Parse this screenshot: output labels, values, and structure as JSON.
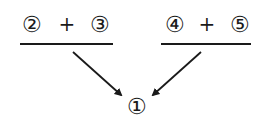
{
  "diagram": {
    "left_group": {
      "a": "②",
      "op": "+",
      "b": "③"
    },
    "right_group": {
      "a": "④",
      "op": "+",
      "b": "⑤"
    },
    "target": "①",
    "colors": {
      "ink": "#1a1a1a",
      "background": "#ffffff"
    }
  }
}
